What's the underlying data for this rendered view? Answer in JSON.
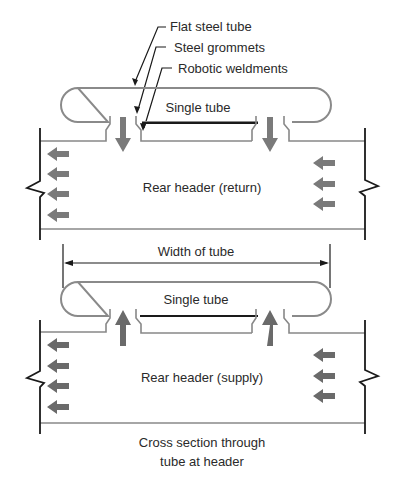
{
  "diagram": {
    "callouts": [
      {
        "id": "flat-steel-tube",
        "label": "Flat steel tube"
      },
      {
        "id": "steel-grommets",
        "label": "Steel grommets"
      },
      {
        "id": "robotic-weldments",
        "label": "Robotic weldments"
      }
    ],
    "top_section": {
      "tube_label": "Single tube",
      "header_label": "Rear header (return)",
      "flow_direction": "down-into-header",
      "left_arrows": 4,
      "right_arrows": 3
    },
    "dimension": {
      "label": "Width of tube"
    },
    "bottom_section": {
      "tube_label": "Single tube",
      "header_label": "Rear header (supply)",
      "flow_direction": "up-into-tube",
      "left_arrows": 4,
      "right_arrows": 3
    },
    "caption": {
      "line1": "Cross section through",
      "line2": "tube at header"
    },
    "colors": {
      "line": "#1a1a1a",
      "tube_outline": "#8a8a8a",
      "flow_arrow": "#7a7a7a",
      "background": "#ffffff"
    }
  }
}
